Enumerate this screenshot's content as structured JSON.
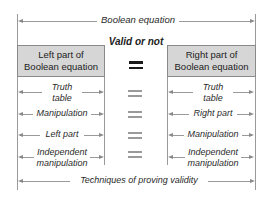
{
  "top": {
    "label": "Boolean equation"
  },
  "center": {
    "label": "Valid or not",
    "equals_symbol": "="
  },
  "left_box": {
    "line1": "Left part of",
    "line2": "Boolean equation"
  },
  "right_box": {
    "line1": "Right part of",
    "line2": "Boolean equation"
  },
  "left_rows": [
    {
      "line1": "Truth",
      "line2": "table"
    },
    {
      "line1": "Manipulation"
    },
    {
      "line1": "Left part"
    },
    {
      "line1": "Independent",
      "line2": "manipulation"
    }
  ],
  "right_rows": [
    {
      "line1": "Truth",
      "line2": "table"
    },
    {
      "line1": "Right part"
    },
    {
      "line1": "Manipulation"
    },
    {
      "line1": "Independent",
      "line2": "manipulation"
    }
  ],
  "bottom": {
    "label": "Techniques of proving validity"
  },
  "colors": {
    "box_fill": "#d6d6d6",
    "line": "#9a9a9a",
    "text": "#2a2a2a"
  }
}
